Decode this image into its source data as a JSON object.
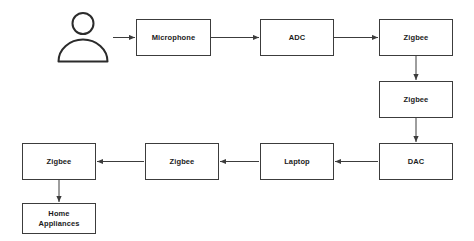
{
  "diagram": {
    "background_color": "#ffffff",
    "stroke_color": "#3c3c3c",
    "text_color": "#1b1b1b",
    "actor": {
      "icon": "person-icon",
      "label": ""
    },
    "nodes": [
      {
        "id": "microphone",
        "label": "Microphone",
        "x": 136,
        "y": 19,
        "w": 75,
        "h": 37
      },
      {
        "id": "adc",
        "label": "ADC",
        "x": 260,
        "y": 19,
        "w": 74,
        "h": 37
      },
      {
        "id": "zigbee-1",
        "label": "Zigbee",
        "x": 379,
        "y": 19,
        "w": 74,
        "h": 37
      },
      {
        "id": "zigbee-2",
        "label": "Zigbee",
        "x": 379,
        "y": 81,
        "w": 74,
        "h": 37
      },
      {
        "id": "dac",
        "label": "DAC",
        "x": 379,
        "y": 143,
        "w": 74,
        "h": 37
      },
      {
        "id": "laptop",
        "label": "Laptop",
        "x": 260,
        "y": 143,
        "w": 74,
        "h": 37
      },
      {
        "id": "zigbee-3",
        "label": "Zigbee",
        "x": 145,
        "y": 143,
        "w": 74,
        "h": 37
      },
      {
        "id": "zigbee-4",
        "label": "Zigbee",
        "x": 22,
        "y": 143,
        "w": 74,
        "h": 37
      },
      {
        "id": "home-appliances",
        "label": "Home\nAppliances",
        "x": 22,
        "y": 203,
        "w": 74,
        "h": 31
      }
    ],
    "edges": [
      {
        "id": "actor-to-microphone",
        "from": "actor",
        "to": "microphone",
        "direction": "right"
      },
      {
        "id": "microphone-to-adc",
        "from": "microphone",
        "to": "adc",
        "direction": "right"
      },
      {
        "id": "adc-to-zigbee-1",
        "from": "adc",
        "to": "zigbee-1",
        "direction": "right"
      },
      {
        "id": "zigbee-1-to-zigbee-2",
        "from": "zigbee-1",
        "to": "zigbee-2",
        "direction": "down"
      },
      {
        "id": "zigbee-2-to-dac",
        "from": "zigbee-2",
        "to": "dac",
        "direction": "down"
      },
      {
        "id": "dac-to-laptop",
        "from": "dac",
        "to": "laptop",
        "direction": "left"
      },
      {
        "id": "laptop-to-zigbee-3",
        "from": "laptop",
        "to": "zigbee-3",
        "direction": "left"
      },
      {
        "id": "zigbee-3-to-zigbee-4",
        "from": "zigbee-3",
        "to": "zigbee-4",
        "direction": "left"
      },
      {
        "id": "zigbee-4-to-home-appliances",
        "from": "zigbee-4",
        "to": "home-appliances",
        "direction": "down"
      }
    ]
  }
}
